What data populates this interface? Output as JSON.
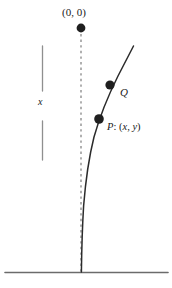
{
  "figure": {
    "labels": {
      "origin": "(0, 0)",
      "q": "Q",
      "p_prefix": "P",
      "p_colon": ":",
      "p_open": "(",
      "p_x": "x",
      "p_comma": ",",
      "p_y": "y",
      "p_close": ")",
      "p_full": "P: (x, y)",
      "x_measure": "x"
    },
    "colors": {
      "ink": "#1a1a1a",
      "curve": "#2b2b2b",
      "dashed": "#6d6d6d",
      "measure_bar": "#8a8a8a",
      "ground": "#6b6b6b",
      "background": "#ffffff"
    },
    "points": [
      {
        "name": "origin",
        "label": "(0, 0)",
        "x": 81,
        "y": 28,
        "radius": 4.4
      },
      {
        "name": "q",
        "label": "Q",
        "x": 110,
        "y": 85,
        "radius": 4.6
      },
      {
        "name": "p",
        "label": "P: (x, y)",
        "x": 99,
        "y": 119,
        "radius": 4.8
      }
    ],
    "elements": {
      "dashed_axis": {
        "x": 81,
        "y_top": 34,
        "y_bottom": 272
      },
      "ground_line": {
        "y": 272,
        "x_start": 5,
        "x_end": 168
      },
      "measure_bar_top": {
        "x": 42,
        "y_start": 46,
        "y_end": 91
      },
      "measure_bar_bottom": {
        "x": 42,
        "y_start": 121,
        "y_end": 160
      },
      "curve": {
        "top_x": 133,
        "top_y": 46,
        "bottom_x": 81,
        "bottom_y": 272
      }
    }
  }
}
